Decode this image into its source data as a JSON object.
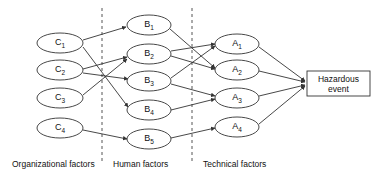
{
  "diagram": {
    "background_color": "#ffffff",
    "line_color": "#333333",
    "divider_color": "#555555",
    "columns": [
      {
        "id": "organizational",
        "caption": "Organizational factors",
        "caption_x": 12,
        "caption_y": 167
      },
      {
        "id": "human",
        "caption": "Human factors",
        "caption_x": 113,
        "caption_y": 167
      },
      {
        "id": "technical",
        "caption": "Technical factors",
        "caption_x": 203,
        "caption_y": 167
      }
    ],
    "dividers": [
      {
        "id": "divider-1",
        "x": 102,
        "y1": 8,
        "y2": 162
      },
      {
        "id": "divider-2",
        "x": 192,
        "y1": 8,
        "y2": 162
      }
    ],
    "nodes": [
      {
        "id": "C1",
        "label": "C",
        "sub": "1",
        "cx": 60,
        "cy": 43,
        "rx": 23,
        "ry": 10,
        "column": "organizational"
      },
      {
        "id": "C2",
        "label": "C",
        "sub": "2",
        "cx": 60,
        "cy": 70,
        "rx": 23,
        "ry": 10,
        "column": "organizational"
      },
      {
        "id": "C3",
        "label": "C",
        "sub": "3",
        "cx": 60,
        "cy": 98,
        "rx": 23,
        "ry": 10,
        "column": "organizational"
      },
      {
        "id": "C4",
        "label": "C",
        "sub": "4",
        "cx": 60,
        "cy": 128,
        "rx": 23,
        "ry": 10,
        "column": "organizational"
      },
      {
        "id": "B1",
        "label": "B",
        "sub": "1",
        "cx": 149,
        "cy": 25,
        "rx": 22,
        "ry": 10,
        "column": "human"
      },
      {
        "id": "B2",
        "label": "B",
        "sub": "2",
        "cx": 149,
        "cy": 54,
        "rx": 22,
        "ry": 10,
        "column": "human"
      },
      {
        "id": "B3",
        "label": "B",
        "sub": "3",
        "cx": 149,
        "cy": 81,
        "rx": 22,
        "ry": 10,
        "column": "human"
      },
      {
        "id": "B4",
        "label": "B",
        "sub": "4",
        "cx": 149,
        "cy": 110,
        "rx": 22,
        "ry": 10,
        "column": "human"
      },
      {
        "id": "B5",
        "label": "B",
        "sub": "5",
        "cx": 149,
        "cy": 139,
        "rx": 22,
        "ry": 10,
        "column": "human"
      },
      {
        "id": "A1",
        "label": "A",
        "sub": "1",
        "cx": 237,
        "cy": 44,
        "rx": 22,
        "ry": 10,
        "column": "technical"
      },
      {
        "id": "A2",
        "label": "A",
        "sub": "2",
        "cx": 237,
        "cy": 70,
        "rx": 22,
        "ry": 10,
        "column": "technical"
      },
      {
        "id": "A3",
        "label": "A",
        "sub": "3",
        "cx": 237,
        "cy": 98,
        "rx": 22,
        "ry": 10,
        "column": "technical"
      },
      {
        "id": "A4",
        "label": "A",
        "sub": "4",
        "cx": 237,
        "cy": 127,
        "rx": 22,
        "ry": 10,
        "column": "technical"
      }
    ],
    "event_box": {
      "id": "hazardous-event",
      "line1": "Hazardous",
      "line2": "event",
      "x": 307,
      "y": 71,
      "width": 63,
      "height": 25
    },
    "edges": [
      {
        "id": "C1-B1",
        "from": "C1",
        "to": "B1",
        "x1": 83,
        "y1": 40,
        "x2": 126,
        "y2": 27
      },
      {
        "id": "C1-B4",
        "from": "C1",
        "to": "B4",
        "x1": 83,
        "y1": 47,
        "x2": 128,
        "y2": 107
      },
      {
        "id": "C2-B2",
        "from": "C2",
        "to": "B2",
        "x1": 83,
        "y1": 69,
        "x2": 127,
        "y2": 57
      },
      {
        "id": "C2-B3",
        "from": "C2",
        "to": "B3",
        "x1": 83,
        "y1": 73,
        "x2": 128,
        "y2": 79
      },
      {
        "id": "C3-B2",
        "from": "C3",
        "to": "B2",
        "x1": 83,
        "y1": 95,
        "x2": 127,
        "y2": 59
      },
      {
        "id": "C4-B5",
        "from": "C4",
        "to": "B5",
        "x1": 83,
        "y1": 130,
        "x2": 127,
        "y2": 139
      },
      {
        "id": "B1-A2",
        "from": "B1",
        "to": "A2",
        "x1": 170,
        "y1": 29,
        "x2": 215,
        "y2": 68
      },
      {
        "id": "B2-A1",
        "from": "B2",
        "to": "A1",
        "x1": 171,
        "y1": 51,
        "x2": 215,
        "y2": 44
      },
      {
        "id": "B2-A2",
        "from": "B2",
        "to": "A2",
        "x1": 171,
        "y1": 56,
        "x2": 215,
        "y2": 69
      },
      {
        "id": "B3-A1",
        "from": "B3",
        "to": "A1",
        "x1": 171,
        "y1": 78,
        "x2": 215,
        "y2": 46
      },
      {
        "id": "B3-A3",
        "from": "B3",
        "to": "A3",
        "x1": 171,
        "y1": 84,
        "x2": 215,
        "y2": 96
      },
      {
        "id": "B4-A3",
        "from": "B4",
        "to": "A3",
        "x1": 171,
        "y1": 110,
        "x2": 215,
        "y2": 99
      },
      {
        "id": "B5-A4",
        "from": "B5",
        "to": "A4",
        "x1": 171,
        "y1": 138,
        "x2": 215,
        "y2": 128
      },
      {
        "id": "A1-EVENT",
        "from": "A1",
        "to": "hazardous-event",
        "x1": 259,
        "y1": 47,
        "x2": 305,
        "y2": 81
      },
      {
        "id": "A2-EVENT",
        "from": "A2",
        "to": "hazardous-event",
        "x1": 259,
        "y1": 71,
        "x2": 305,
        "y2": 82
      },
      {
        "id": "A3-EVENT",
        "from": "A3",
        "to": "hazardous-event",
        "x1": 259,
        "y1": 96,
        "x2": 305,
        "y2": 85
      },
      {
        "id": "A4-EVENT",
        "from": "A4",
        "to": "hazardous-event",
        "x1": 259,
        "y1": 124,
        "x2": 305,
        "y2": 86
      }
    ]
  }
}
